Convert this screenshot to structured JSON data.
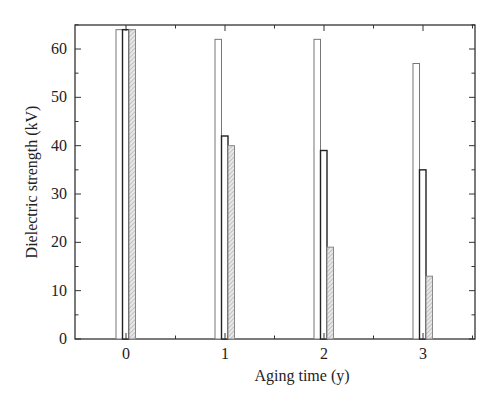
{
  "chart_data": {
    "type": "bar",
    "title": "",
    "xlabel": "Aging time (y)",
    "ylabel": "Dielectric strength (kV)",
    "categories": [
      "0",
      "1",
      "2",
      "3"
    ],
    "series": [
      {
        "name": "Series 1 (open)",
        "values": [
          64,
          62,
          62,
          57
        ],
        "fill": "#ffffff",
        "stroke": "#777777"
      },
      {
        "name": "Series 2 (dark)",
        "values": [
          64,
          42,
          39,
          35
        ],
        "fill": "#ffffff",
        "stroke": "#222222"
      },
      {
        "name": "Series 3 (hatched)",
        "values": [
          64,
          40,
          19,
          13
        ],
        "fill": "#e4e4e4",
        "stroke": "#888888"
      }
    ],
    "ylim": [
      0,
      65
    ],
    "xlim": [
      -0.45,
      3.5
    ],
    "yticks": [
      0,
      10,
      20,
      30,
      40,
      50,
      60
    ],
    "xticks": [
      0,
      1,
      2,
      3
    ],
    "grid": false,
    "legend": "none"
  },
  "axes": {
    "x_label": "Aging time (y)",
    "y_label": "Dielectric strength (kV)",
    "y_tick_labels": [
      "0",
      "10",
      "20",
      "30",
      "40",
      "50",
      "60"
    ],
    "x_tick_labels": [
      "0",
      "1",
      "2",
      "3"
    ]
  }
}
